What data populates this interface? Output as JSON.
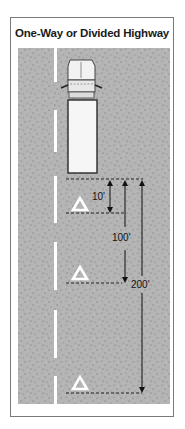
{
  "title": "One-Way or Divided Highway",
  "diagram": {
    "road": {
      "surface_color": "#b3b3b3",
      "speckle_color": "#6e6e6e",
      "lane_line_color": "#ffffff",
      "lane_line_style": "dashed"
    },
    "vehicle": "truck",
    "warning_devices": [
      {
        "name": "triangle-1",
        "distance_label": "10'"
      },
      {
        "name": "triangle-2",
        "distance_label": "100'"
      },
      {
        "name": "triangle-3",
        "distance_label": "200'"
      }
    ],
    "dimensions": {
      "d1": "10'",
      "d2": "100'",
      "d3": "200'"
    }
  }
}
